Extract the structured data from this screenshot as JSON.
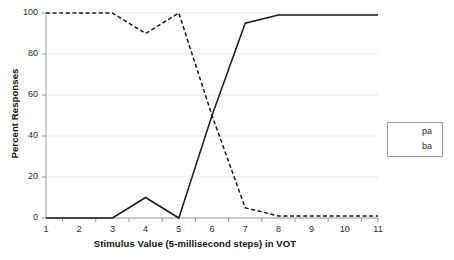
{
  "chart_data": {
    "type": "line",
    "title": "",
    "xlabel": "Stimulus Value (5-millisecond steps) in VOT",
    "ylabel": "Percent Responses",
    "categories": [
      "1",
      "2",
      "3",
      "4",
      "5",
      "6",
      "7",
      "8",
      "9",
      "10",
      "11"
    ],
    "x": [
      1,
      2,
      3,
      4,
      5,
      6,
      7,
      8,
      9,
      10,
      11
    ],
    "ylim": [
      0,
      100
    ],
    "yticks": [
      0,
      20,
      40,
      60,
      80,
      100
    ],
    "ytick_labels": [
      "0",
      "20",
      "40",
      "60",
      "80",
      "100"
    ],
    "grid": "horizontal",
    "legend_position": "right",
    "series": [
      {
        "name": "pa",
        "style": "solid",
        "color": "#1a1a1a",
        "values": [
          0,
          0,
          0,
          10,
          0,
          50,
          95,
          99,
          99,
          99,
          99
        ]
      },
      {
        "name": "ba",
        "style": "dashed",
        "color": "#1a1a1a",
        "values": [
          100,
          100,
          100,
          90,
          100,
          50,
          5,
          1,
          1,
          1,
          1
        ]
      }
    ]
  },
  "legend": {
    "items": [
      {
        "label": "pa",
        "style": "solid"
      },
      {
        "label": "ba",
        "style": "dashed"
      }
    ]
  },
  "colors": {
    "background": "#ffffff",
    "gridline": "#e9e9e9",
    "axis": "#9a9a9a",
    "series": "#1a1a1a",
    "text": "#2b2b2b"
  }
}
